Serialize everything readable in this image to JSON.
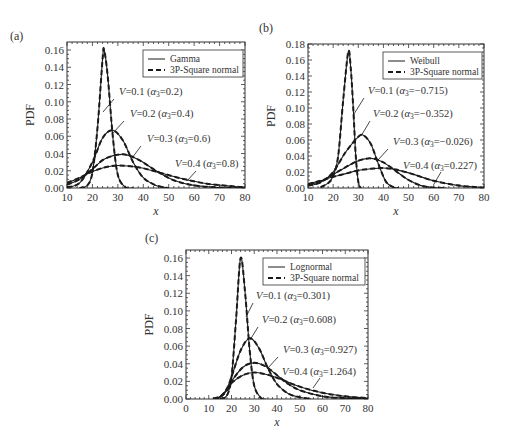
{
  "figure": {
    "panels": [
      {
        "label": "(a)",
        "legend": {
          "solid": "Gamma",
          "dashed": "3P-Square normal"
        },
        "annotations": [
          {
            "v": "V",
            "eq": "=0.1 (",
            "alpha": "α",
            "sub": "3",
            "rest": "=0.2)"
          },
          {
            "v": "V",
            "eq": "=0.2 (",
            "alpha": "α",
            "sub": "3",
            "rest": "=0.4)"
          },
          {
            "v": "V",
            "eq": "=0.3 (",
            "alpha": "α",
            "sub": "3",
            "rest": "=0.6)"
          },
          {
            "v": "V",
            "eq": "=0.4 (",
            "alpha": "α",
            "sub": "3",
            "rest": "=0.8)"
          }
        ]
      },
      {
        "label": "(b)",
        "legend": {
          "solid": "Weibull",
          "dashed": "3P-Square normal"
        },
        "annotations": [
          {
            "v": "V",
            "eq": "=0.1 (",
            "alpha": "α",
            "sub": "3",
            "rest": "=−0.715)"
          },
          {
            "v": "V",
            "eq": "=0.2 (",
            "alpha": "α",
            "sub": "3",
            "rest": "=−0.352)"
          },
          {
            "v": "V",
            "eq": "=0.3 (",
            "alpha": "α",
            "sub": "3",
            "rest": "=−0.026)"
          },
          {
            "v": "V",
            "eq": "=0.4 (",
            "alpha": "α",
            "sub": "3",
            "rest": "=0.227)"
          }
        ]
      },
      {
        "label": "(c)",
        "legend": {
          "solid": "Lognormal",
          "dashed": "3P-Square normal"
        },
        "annotations": [
          {
            "v": "V",
            "eq": "=0.1 (",
            "alpha": "α",
            "sub": "3",
            "rest": "=0.301)"
          },
          {
            "v": "V",
            "eq": "=0.2 (",
            "alpha": "α",
            "sub": "3",
            "rest": "=0.608)"
          },
          {
            "v": "V",
            "eq": "=0.3 (",
            "alpha": "α",
            "sub": "3",
            "rest": "=0.927)"
          },
          {
            "v": "V",
            "eq": "=0.4 (",
            "alpha": "α",
            "sub": "3",
            "rest": "=1.264)"
          }
        ]
      }
    ],
    "colors": {
      "line": "#1a1a1a",
      "axis": "#333333",
      "background": "#ffffff"
    }
  },
  "chart_data": [
    {
      "type": "line",
      "panel": "(a)",
      "title": "",
      "xlabel": "x",
      "ylabel": "PDF",
      "xlim": [
        10,
        80
      ],
      "ylim": [
        0,
        0.16
      ],
      "xticks": [
        10,
        20,
        30,
        40,
        50,
        60,
        70,
        80
      ],
      "yticks": [
        0.0,
        0.02,
        0.04,
        0.06,
        0.08,
        0.1,
        0.12,
        0.14,
        0.16
      ],
      "ytick_labels": [
        "0.00",
        "0.02",
        "0.04",
        "0.06",
        "0.08",
        "0.10",
        "0.12",
        "0.14",
        "0.16"
      ],
      "legend": [
        "Gamma",
        "3P-Square normal"
      ],
      "legend_position": "upper right",
      "grid": false,
      "series": [
        {
          "name": "V=0.1 (α3=0.2)",
          "points": [
            [
              15,
              0
            ],
            [
              18,
              0.003
            ],
            [
              20,
              0.018
            ],
            [
              22,
              0.07
            ],
            [
              24,
              0.15
            ],
            [
              24.6,
              0.16
            ],
            [
              26,
              0.13
            ],
            [
              28,
              0.06
            ],
            [
              30,
              0.015
            ],
            [
              33,
              0.001
            ],
            [
              36,
              0
            ]
          ]
        },
        {
          "name": "V=0.2 (α3=0.4)",
          "points": [
            [
              10,
              0.001
            ],
            [
              15,
              0.006
            ],
            [
              20,
              0.03
            ],
            [
              24,
              0.058
            ],
            [
              28,
              0.067
            ],
            [
              32,
              0.055
            ],
            [
              36,
              0.03
            ],
            [
              40,
              0.012
            ],
            [
              45,
              0.003
            ],
            [
              50,
              0
            ]
          ]
        },
        {
          "name": "V=0.3 (α3=0.6)",
          "points": [
            [
              10,
              0.004
            ],
            [
              15,
              0.01
            ],
            [
              20,
              0.022
            ],
            [
              25,
              0.034
            ],
            [
              32,
              0.039
            ],
            [
              38,
              0.033
            ],
            [
              45,
              0.02
            ],
            [
              52,
              0.009
            ],
            [
              60,
              0.003
            ],
            [
              70,
              0.0005
            ],
            [
              80,
              0
            ]
          ]
        },
        {
          "name": "V=0.4 (α3=0.8)",
          "points": [
            [
              10,
              0.006
            ],
            [
              15,
              0.012
            ],
            [
              20,
              0.019
            ],
            [
              25,
              0.024
            ],
            [
              30,
              0.026
            ],
            [
              38,
              0.024
            ],
            [
              45,
              0.019
            ],
            [
              55,
              0.011
            ],
            [
              65,
              0.005
            ],
            [
              75,
              0.002
            ],
            [
              80,
              0.001
            ]
          ]
        }
      ]
    },
    {
      "type": "line",
      "panel": "(b)",
      "title": "",
      "xlabel": "x",
      "ylabel": "PDF",
      "xlim": [
        10,
        80
      ],
      "ylim": [
        0,
        0.18
      ],
      "xticks": [
        10,
        20,
        30,
        40,
        50,
        60,
        70,
        80
      ],
      "yticks": [
        0.0,
        0.02,
        0.04,
        0.06,
        0.08,
        0.1,
        0.12,
        0.14,
        0.16,
        0.18
      ],
      "ytick_labels": [
        "0.00",
        "0.02",
        "0.04",
        "0.06",
        "0.08",
        "0.10",
        "0.12",
        "0.14",
        "0.16",
        "0.18"
      ],
      "legend": [
        "Weibull",
        "3P-Square normal"
      ],
      "legend_position": "upper right",
      "grid": false,
      "series": [
        {
          "name": "V=0.1 (α3=−0.715)",
          "points": [
            [
              15,
              0.001
            ],
            [
              18,
              0.006
            ],
            [
              20,
              0.015
            ],
            [
              22,
              0.04
            ],
            [
              24,
              0.11
            ],
            [
              26,
              0.17
            ],
            [
              27,
              0.15
            ],
            [
              28,
              0.1
            ],
            [
              29,
              0.04
            ],
            [
              30,
              0.008
            ],
            [
              31,
              0
            ]
          ]
        },
        {
          "name": "V=0.2 (α3=−0.352)",
          "points": [
            [
              10,
              0.003
            ],
            [
              15,
              0.007
            ],
            [
              20,
              0.02
            ],
            [
              25,
              0.045
            ],
            [
              30,
              0.064
            ],
            [
              32,
              0.066
            ],
            [
              35,
              0.055
            ],
            [
              38,
              0.03
            ],
            [
              41,
              0.008
            ],
            [
              44,
              0.001
            ],
            [
              46,
              0
            ]
          ]
        },
        {
          "name": "V=0.3 (α3=−0.026)",
          "points": [
            [
              10,
              0.004
            ],
            [
              15,
              0.008
            ],
            [
              20,
              0.017
            ],
            [
              25,
              0.026
            ],
            [
              30,
              0.034
            ],
            [
              35,
              0.037
            ],
            [
              40,
              0.032
            ],
            [
              45,
              0.021
            ],
            [
              50,
              0.01
            ],
            [
              55,
              0.003
            ],
            [
              60,
              0.0005
            ],
            [
              65,
              0
            ]
          ]
        },
        {
          "name": "V=0.4 (α3=0.227)",
          "points": [
            [
              10,
              0.005
            ],
            [
              15,
              0.009
            ],
            [
              20,
              0.014
            ],
            [
              25,
              0.018
            ],
            [
              30,
              0.022
            ],
            [
              35,
              0.024
            ],
            [
              40,
              0.025
            ],
            [
              45,
              0.023
            ],
            [
              52,
              0.017
            ],
            [
              60,
              0.009
            ],
            [
              70,
              0.003
            ],
            [
              80,
              0.0005
            ]
          ]
        }
      ]
    },
    {
      "type": "line",
      "panel": "(c)",
      "title": "",
      "xlabel": "x",
      "ylabel": "PDF",
      "xlim": [
        0,
        80
      ],
      "ylim": [
        0,
        0.16
      ],
      "xticks": [
        0,
        10,
        20,
        30,
        40,
        50,
        60,
        70,
        80
      ],
      "yticks": [
        0.0,
        0.02,
        0.04,
        0.06,
        0.08,
        0.1,
        0.12,
        0.14,
        0.16
      ],
      "ytick_labels": [
        "0.00",
        "0.02",
        "0.04",
        "0.06",
        "0.08",
        "0.10",
        "0.12",
        "0.14",
        "0.16"
      ],
      "legend": [
        "Lognormal",
        "3P-Square normal"
      ],
      "legend_position": "upper right",
      "grid": false,
      "series": [
        {
          "name": "V=0.1 (α3=0.301)",
          "points": [
            [
              15,
              0
            ],
            [
              18,
              0.004
            ],
            [
              20,
              0.025
            ],
            [
              22,
              0.09
            ],
            [
              24,
              0.16
            ],
            [
              26,
              0.12
            ],
            [
              28,
              0.055
            ],
            [
              30,
              0.015
            ],
            [
              33,
              0.001
            ],
            [
              35,
              0
            ]
          ]
        },
        {
          "name": "V=0.2 (α3=0.608)",
          "points": [
            [
              12,
              0
            ],
            [
              15,
              0.002
            ],
            [
              18,
              0.012
            ],
            [
              20,
              0.025
            ],
            [
              24,
              0.055
            ],
            [
              28,
              0.069
            ],
            [
              32,
              0.058
            ],
            [
              36,
              0.035
            ],
            [
              40,
              0.017
            ],
            [
              45,
              0.006
            ],
            [
              50,
              0.002
            ],
            [
              55,
              0
            ]
          ]
        },
        {
          "name": "V=0.3 (α3=0.927)",
          "points": [
            [
              12,
              0
            ],
            [
              15,
              0.002
            ],
            [
              18,
              0.01
            ],
            [
              20,
              0.02
            ],
            [
              25,
              0.036
            ],
            [
              30,
              0.041
            ],
            [
              35,
              0.037
            ],
            [
              40,
              0.027
            ],
            [
              45,
              0.017
            ],
            [
              50,
              0.01
            ],
            [
              60,
              0.003
            ],
            [
              70,
              0.001
            ],
            [
              80,
              0
            ]
          ]
        },
        {
          "name": "V=0.4 (α3=1.264)",
          "points": [
            [
              12,
              0.0005
            ],
            [
              15,
              0.003
            ],
            [
              18,
              0.01
            ],
            [
              20,
              0.018
            ],
            [
              25,
              0.027
            ],
            [
              30,
              0.03
            ],
            [
              35,
              0.028
            ],
            [
              40,
              0.024
            ],
            [
              50,
              0.014
            ],
            [
              60,
              0.007
            ],
            [
              70,
              0.003
            ],
            [
              80,
              0.001
            ]
          ]
        }
      ]
    }
  ],
  "layout": [
    {
      "box": [
        67,
        42,
        245,
        188
      ],
      "label_pos": [
        10,
        40
      ],
      "legend_box": [
        143,
        50,
        243,
        77
      ],
      "annot_pos": [
        [
          119,
          95
        ],
        [
          130,
          117
        ],
        [
          147,
          142
        ],
        [
          175,
          167
        ]
      ],
      "leader": [
        [
          [
            114,
            99
          ],
          [
            103,
            112
          ]
        ],
        [
          [
            124,
            121
          ],
          [
            113,
            133
          ]
        ],
        [
          [
            141,
            146
          ],
          [
            132,
            158
          ]
        ],
        [
          [
            196,
            171
          ],
          [
            187,
            181
          ]
        ]
      ]
    },
    {
      "box": [
        308,
        44,
        484,
        188
      ],
      "label_pos": [
        259,
        32
      ],
      "legend_box": [
        383,
        52,
        482,
        79
      ],
      "annot_pos": [
        [
          368,
          94
        ],
        [
          373,
          117
        ],
        [
          393,
          145
        ],
        [
          403,
          169
        ]
      ],
      "leader": [
        [
          [
            364,
            98
          ],
          [
            354,
            114
          ]
        ],
        [
          [
            370,
            121
          ],
          [
            361,
            136
          ]
        ],
        [
          [
            388,
            149
          ],
          [
            378,
            160
          ]
        ],
        [
          [
            441,
            172
          ],
          [
            434,
            184
          ]
        ]
      ]
    },
    {
      "box": [
        186,
        250,
        368,
        399
      ],
      "label_pos": [
        145,
        242
      ],
      "legend_box": [
        263,
        258,
        365,
        285
      ],
      "annot_pos": [
        [
          256,
          299
        ],
        [
          262,
          323
        ],
        [
          283,
          353
        ],
        [
          282,
          375
        ]
      ],
      "leader": [
        [
          [
            253,
            303
          ],
          [
            246,
            317
          ]
        ],
        [
          [
            258,
            327
          ],
          [
            250,
            340
          ]
        ],
        [
          [
            278,
            357
          ],
          [
            267,
            369
          ]
        ],
        [
          [
            320,
            378
          ],
          [
            313,
            388
          ]
        ]
      ]
    }
  ]
}
